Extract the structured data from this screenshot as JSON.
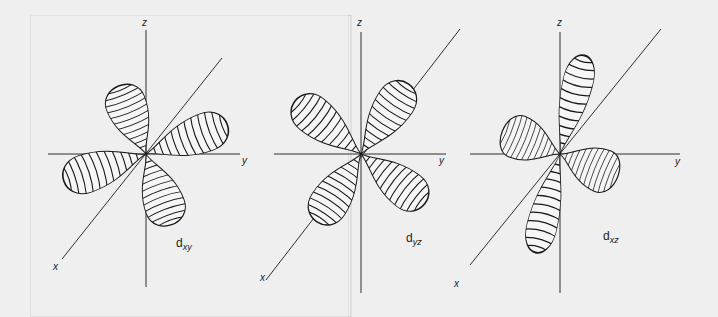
{
  "figure": {
    "panels": [
      {
        "id": "dxy",
        "orbital_label": "d",
        "orbital_subscript": "xy",
        "axes": {
          "z": "z",
          "x": "x",
          "y": ""
        }
      },
      {
        "id": "dyz",
        "orbital_label": "d",
        "orbital_subscript": "yz",
        "axes": {
          "z": "z",
          "x": "x",
          "y": "y"
        }
      },
      {
        "id": "dxz",
        "orbital_label": "d",
        "orbital_subscript": "xz",
        "axes": {
          "z": "z",
          "x": "x",
          "y": "y"
        }
      }
    ]
  },
  "colors": {
    "background": "#efefef",
    "line": "#1a1a1a",
    "lobe_fill": "#f4f4f4"
  }
}
